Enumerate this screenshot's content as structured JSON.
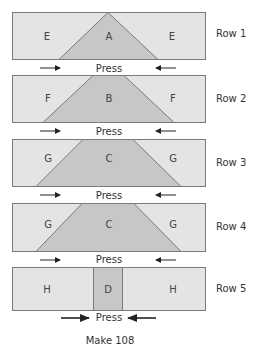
{
  "colors": {
    "light": "#e4e4e4",
    "dark": "#c7c7c7",
    "outline": "#7a7a7a",
    "text": "#333333",
    "arrow": "#222222"
  },
  "rows": [
    {
      "label": "Row 1",
      "left_piece": "E",
      "center_piece": "A",
      "right_piece": "E",
      "press": "Press"
    },
    {
      "label": "Row 2",
      "left_piece": "F",
      "center_piece": "B",
      "right_piece": "F",
      "press": "Press"
    },
    {
      "label": "Row 3",
      "left_piece": "G",
      "center_piece": "C",
      "right_piece": "G",
      "press": "Press"
    },
    {
      "label": "Row 4",
      "left_piece": "G",
      "center_piece": "C",
      "right_piece": "G",
      "press": "Press"
    },
    {
      "label": "Row 5",
      "left_piece": "H",
      "center_piece": "D",
      "right_piece": "H",
      "press": "Press"
    }
  ],
  "footer": "Make 108"
}
